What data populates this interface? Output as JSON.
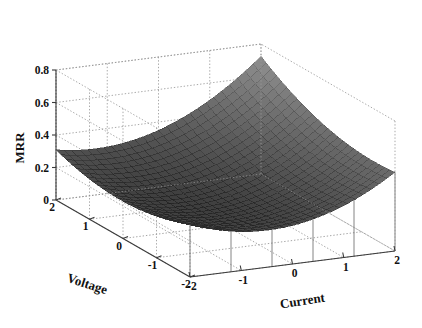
{
  "chart_data": {
    "type": "surface",
    "title": "",
    "xlabel": "Current",
    "ylabel": "Voltage",
    "zlabel": "MRR",
    "xlim": [
      -2,
      2
    ],
    "ylim": [
      -2,
      2
    ],
    "zlim": [
      0,
      0.8
    ],
    "x_ticks": [
      -2,
      -1,
      0,
      1,
      2
    ],
    "y_ticks": [
      2,
      1,
      0,
      -1,
      -2
    ],
    "z_ticks": [
      0,
      0.2,
      0.4,
      0.6,
      0.8
    ],
    "x_tick_labels": [
      "-2",
      "-1",
      "0",
      "1",
      "2"
    ],
    "y_tick_labels": [
      "2",
      "1",
      "0",
      "-1",
      "-2"
    ],
    "z_tick_labels": [
      "0",
      "0.2",
      "0.4",
      "0.6",
      "0.8"
    ],
    "grid": true,
    "legend": "none",
    "colormap": "grayscale",
    "surface_color": "#4a4a4a",
    "mesh_color": "#1e1e1e",
    "model": {
      "form": "z = c0 + c1*x + c2*y + c3*x^2 + c4*y^2 + c5*x*y",
      "c0": 0.205,
      "c1": 0.072,
      "c2": 0.028,
      "c3": 0.042,
      "c4": 0.022,
      "c5": 0.016
    },
    "grid_n": 26,
    "x": [
      -2,
      -1.6,
      -1.2,
      -0.8,
      -0.4,
      0,
      0.4,
      0.8,
      1.2,
      1.6,
      2
    ],
    "y": [
      -2,
      -1.6,
      -1.2,
      -0.8,
      -0.4,
      0,
      0.4,
      0.8,
      1.2,
      1.6,
      2
    ],
    "z_matrix": [
      [
        0.293,
        0.222,
        0.168,
        0.131,
        0.111,
        0.107,
        0.12,
        0.15,
        0.196,
        0.259,
        0.339
      ],
      [
        0.294,
        0.217,
        0.157,
        0.114,
        0.088,
        0.079,
        0.086,
        0.11,
        0.151,
        0.208,
        0.282
      ],
      [
        0.303,
        0.221,
        0.155,
        0.106,
        0.074,
        0.059,
        0.061,
        0.079,
        0.114,
        0.166,
        0.234
      ],
      [
        0.321,
        0.232,
        0.161,
        0.106,
        0.068,
        0.048,
        0.044,
        0.057,
        0.086,
        0.132,
        0.195
      ],
      [
        0.346,
        0.252,
        0.175,
        0.114,
        0.071,
        0.045,
        0.035,
        0.042,
        0.066,
        0.106,
        0.163
      ],
      [
        0.381,
        0.281,
        0.197,
        0.131,
        0.081,
        0.05,
        0.035,
        0.036,
        0.054,
        0.089,
        0.14
      ],
      [
        0.423,
        0.317,
        0.228,
        0.155,
        0.1,
        0.063,
        0.043,
        0.039,
        0.051,
        0.08,
        0.126
      ],
      [
        0.474,
        0.362,
        0.267,
        0.189,
        0.128,
        0.085,
        0.058,
        0.049,
        0.056,
        0.079,
        0.12
      ],
      [
        0.533,
        0.415,
        0.314,
        0.23,
        0.164,
        0.115,
        0.083,
        0.068,
        0.069,
        0.087,
        0.122
      ],
      [
        0.601,
        0.477,
        0.37,
        0.28,
        0.208,
        0.153,
        0.116,
        0.095,
        0.091,
        0.104,
        0.133
      ],
      [
        0.677,
        0.547,
        0.434,
        0.339,
        0.261,
        0.2,
        0.157,
        0.131,
        0.122,
        0.129,
        0.153
      ]
    ],
    "z_min_approx": 0.035,
    "z_max_approx": 0.68,
    "view": {
      "azimuth": -37.5,
      "elevation": 30
    }
  },
  "axes": {
    "z": {
      "title": "MRR",
      "ticks": [
        "0.8",
        "0.6",
        "0.4",
        "0.2",
        "0"
      ]
    },
    "y": {
      "title": "Voltage",
      "ticks": [
        "2",
        "1",
        "0",
        "-1",
        "-2"
      ]
    },
    "x": {
      "title": "Current",
      "ticks": [
        "-2",
        "-1",
        "0",
        "1",
        "2"
      ]
    }
  }
}
